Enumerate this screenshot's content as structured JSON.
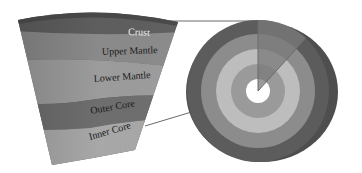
{
  "diagram": {
    "layers": [
      {
        "name": "Crust",
        "label": "Crust",
        "color": "#5e5e5e",
        "text_color": "#f2f2f2"
      },
      {
        "name": "Upper Mantle",
        "label": "Upper Mantle",
        "color": "#8a8a8a",
        "text_color": "#1a1a1a"
      },
      {
        "name": "Lower Mantle",
        "label": "Lower Mantle",
        "color": "#9c9c9c",
        "text_color": "#1a1a1a"
      },
      {
        "name": "Outer Core",
        "label": "Outer Core",
        "color": "#6e6e6e",
        "text_color": "#1a1a1a"
      },
      {
        "name": "Inner Core",
        "label": "Inner Core",
        "color": "#a8a8a8",
        "text_color": "#1a1a1a"
      }
    ],
    "cross_section": {
      "rings": [
        {
          "layer": "Crust",
          "color": "#5a5a5a"
        },
        {
          "layer": "Upper Mantle",
          "color": "#8c8c8c"
        },
        {
          "layer": "Lower Mantle",
          "color": "#bdbdbd"
        },
        {
          "layer": "Outer Core",
          "color": "#9a9a9a"
        },
        {
          "layer": "Inner Core",
          "color": "#ffffff"
        }
      ],
      "wedge_highlight_color": "#7a7a7a"
    },
    "connector_color": "#6a6a6a"
  }
}
